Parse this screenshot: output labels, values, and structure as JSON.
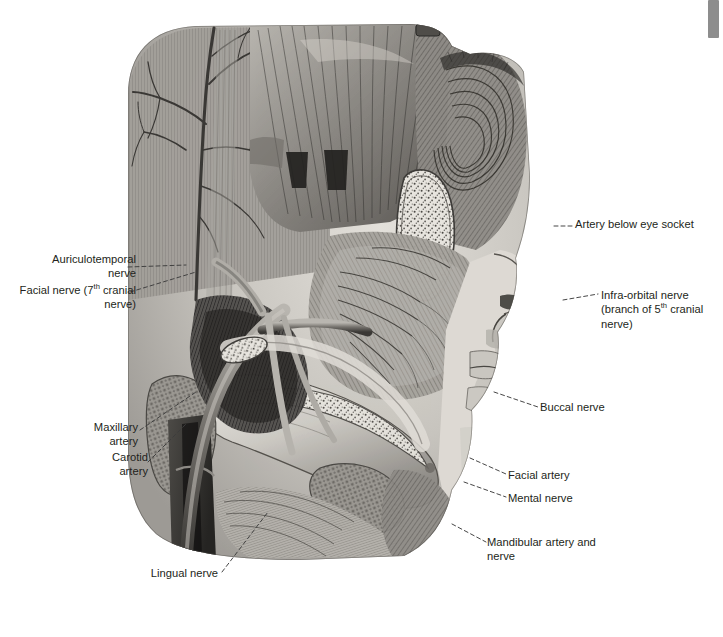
{
  "document": {
    "title": "Dissection of the face — arteries and nerves",
    "figure_alt": "Grayscale anatomical engraving of a lateral head dissection showing facial muscles, mandible, arteries and nerves"
  },
  "scrollbar": {
    "name": "vertical-scrollbar",
    "thumb_top_px": 0,
    "thumb_height_px": 38,
    "track_color": "#ffffff",
    "thumb_color": "#8d8d8d"
  },
  "colors": {
    "page_background": "#ffffff",
    "label_text": "#231f20",
    "leader_line": "#3c3c3c",
    "illustration_ink_dark": "#2e2e2e",
    "illustration_mid": "#8a8a8a",
    "illustration_light": "#d8d5d0"
  },
  "labels": {
    "left": [
      {
        "id": "auriculotemporal-nerve",
        "text": "Auriculotemporal\nnerve",
        "line_style": "dashed"
      },
      {
        "id": "facial-nerve",
        "text_parts": [
          "Facial nerve (7",
          "th",
          " cranial\nnerve)"
        ],
        "text": "Facial nerve (7th cranial\nnerve)",
        "line_style": "dashed"
      },
      {
        "id": "maxillary-artery",
        "text": "Maxillary\nartery",
        "line_style": "dashed"
      },
      {
        "id": "carotid-artery",
        "text": "Carotid\nartery",
        "line_style": "dashed"
      },
      {
        "id": "lingual-nerve",
        "text": "Lingual nerve",
        "line_style": "dashed"
      }
    ],
    "right": [
      {
        "id": "artery-below-eye-socket",
        "text": "Artery below eye socket",
        "line_style": "dashed"
      },
      {
        "id": "infra-orbital-nerve",
        "text_parts": [
          "Infra-orbital nerve\n(branch of 5",
          "th",
          " cranial\nnerve)"
        ],
        "text": "Infra-orbital nerve\n(branch of 5th cranial\nnerve)",
        "line_style": "dashed"
      },
      {
        "id": "buccal-nerve",
        "text": "Buccal nerve",
        "line_style": "dashed"
      },
      {
        "id": "facial-artery",
        "text": "Facial artery",
        "line_style": "dashed"
      },
      {
        "id": "mental-nerve",
        "text": "Mental nerve",
        "line_style": "dashed"
      },
      {
        "id": "mandibular-artery-and-nerve",
        "text": "Mandibular artery and\nnerve",
        "line_style": "dashed"
      }
    ]
  }
}
